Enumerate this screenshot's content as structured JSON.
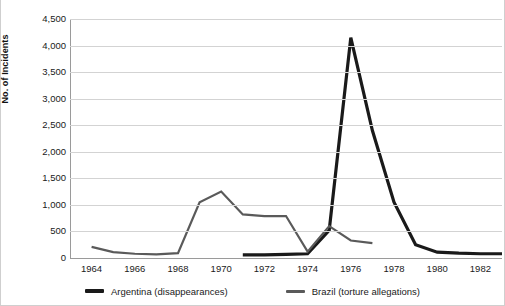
{
  "chart_data": {
    "type": "line",
    "title": "",
    "xlabel": "",
    "ylabel": "No. of Incidents",
    "xlim": [
      1963,
      1983
    ],
    "ylim": [
      0,
      4500
    ],
    "grid": true,
    "legend_position": "bottom",
    "y_ticks": [
      "4,500",
      "4,000",
      "3,500",
      "3,000",
      "2,500",
      "2,000",
      "1,500",
      "1,000",
      "500",
      "0"
    ],
    "y_tick_values": [
      4500,
      4000,
      3500,
      3000,
      2500,
      2000,
      1500,
      1000,
      500,
      0
    ],
    "x_ticks": [
      "1964",
      "1966",
      "1968",
      "1970",
      "1972",
      "1974",
      "1976",
      "1978",
      "1980",
      "1982"
    ],
    "x_tick_values": [
      1964,
      1966,
      1968,
      1970,
      1972,
      1974,
      1976,
      1978,
      1980,
      1982
    ],
    "series": [
      {
        "name": "Argentina (disappearances)",
        "color": "#1a1a1a",
        "width": 3.2,
        "x": [
          1971,
          1972,
          1973,
          1974,
          1975,
          1976,
          1977,
          1978,
          1979,
          1980,
          1981,
          1982,
          1983
        ],
        "values": [
          60,
          60,
          70,
          80,
          520,
          4150,
          2400,
          1050,
          250,
          110,
          90,
          80,
          80
        ]
      },
      {
        "name": "Brazil (torture allegations)",
        "color": "#5a5a5a",
        "width": 2.2,
        "x": [
          1964,
          1965,
          1966,
          1967,
          1968,
          1969,
          1970,
          1971,
          1972,
          1973,
          1974,
          1975,
          1976,
          1977
        ],
        "values": [
          210,
          110,
          80,
          70,
          90,
          1050,
          1250,
          820,
          790,
          790,
          120,
          600,
          330,
          280
        ]
      }
    ]
  },
  "legend": {
    "items": [
      {
        "label": "Argentina (disappearances)",
        "color": "#1a1a1a",
        "thickness": "4px"
      },
      {
        "label": "Brazil (torture allegations)",
        "color": "#5a5a5a",
        "thickness": "3px"
      }
    ]
  },
  "axis": {
    "y_title": "No. of Incidents"
  }
}
